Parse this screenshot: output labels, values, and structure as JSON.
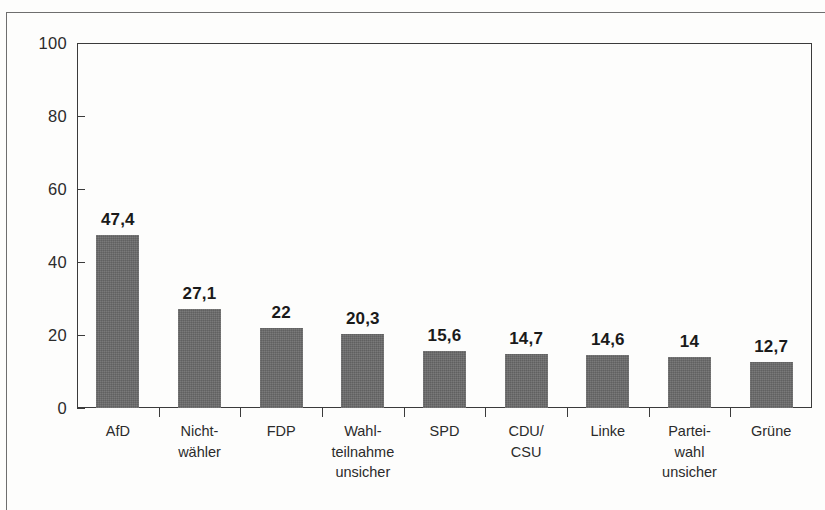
{
  "chart_data": {
    "type": "bar",
    "title": "",
    "subtitle": "",
    "xlabel": "",
    "ylabel": "",
    "ylim": [
      0,
      100
    ],
    "yticks": [
      0,
      20,
      40,
      60,
      80,
      100
    ],
    "ytick_labels": [
      "0",
      "20",
      "40",
      "60",
      "80",
      "100"
    ],
    "grid": false,
    "legend": false,
    "categories": [
      "AfD",
      "Nicht-\nwähler",
      "FDP",
      "Wahl-\nteilnahme\nunsicher",
      "SPD",
      "CDU/\nCSU",
      "Linke",
      "Partei-\nwahl\nunsicher",
      "Grüne"
    ],
    "values": [
      47.4,
      27.1,
      22,
      20.3,
      15.6,
      14.7,
      14.6,
      14,
      12.7
    ],
    "value_labels": [
      "47,4",
      "27,1",
      "22",
      "20,3",
      "15,6",
      "14,7",
      "14,6",
      "14",
      "12,7"
    ],
    "bar_color": "#6a6a6a",
    "axis_color": "#3b3b3b",
    "text_color": "#2b2b2b",
    "background_color": "#fdfdfc"
  }
}
